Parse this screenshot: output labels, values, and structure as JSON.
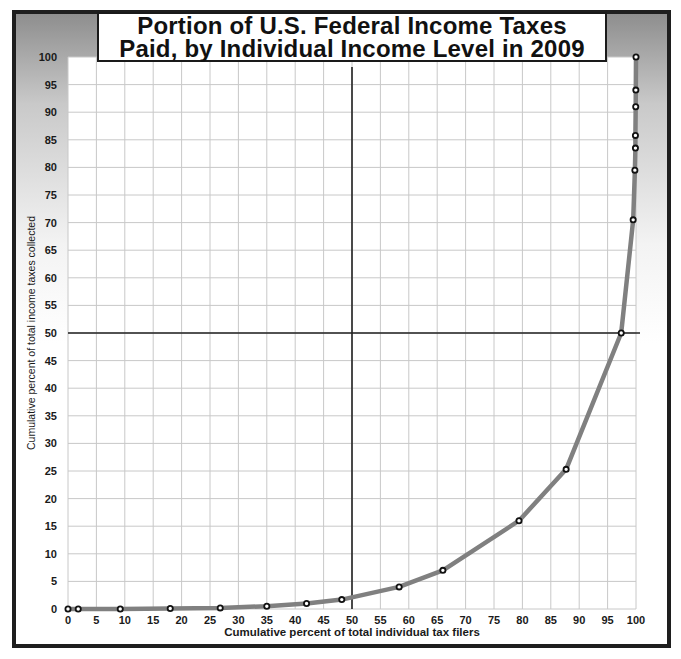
{
  "title": {
    "line1": "Portion of U.S. Federal Income Taxes",
    "line2": "Paid, by Individual Income Level in 2009"
  },
  "chart_data": {
    "type": "line",
    "title": "Portion of U.S. Federal Income Taxes Paid, by Individual Income Level in 2009",
    "xlabel": "Cumulative percent of total individual tax filers",
    "ylabel": "Cumulative percent  of  total income taxes collected",
    "xlim": [
      0,
      100
    ],
    "ylim": [
      0,
      100
    ],
    "x_ticks": [
      0,
      5,
      10,
      15,
      20,
      25,
      30,
      35,
      40,
      45,
      50,
      55,
      60,
      65,
      70,
      75,
      80,
      85,
      90,
      95,
      100
    ],
    "y_ticks": [
      0,
      5,
      10,
      15,
      20,
      25,
      30,
      35,
      40,
      45,
      50,
      55,
      60,
      65,
      70,
      75,
      80,
      85,
      90,
      95,
      100
    ],
    "grid": true,
    "reference_lines": {
      "x": 50,
      "y": 50
    },
    "series": [
      {
        "name": "Cumulative share of income taxes",
        "color": "#808080",
        "marker_color": "#111111",
        "points": [
          [
            0,
            0
          ],
          [
            1.8,
            0
          ],
          [
            9.2,
            0
          ],
          [
            18,
            0.1
          ],
          [
            26.8,
            0.2
          ],
          [
            35,
            0.5
          ],
          [
            42,
            1.0
          ],
          [
            48.2,
            1.7
          ],
          [
            58.3,
            4.0
          ],
          [
            66,
            7.0
          ],
          [
            79.4,
            16.0
          ],
          [
            87.7,
            25.3
          ],
          [
            97.4,
            50.0
          ],
          [
            99.5,
            70.5
          ],
          [
            99.8,
            79.5
          ],
          [
            99.9,
            83.5
          ],
          [
            99.9,
            85.8
          ],
          [
            99.95,
            91.0
          ],
          [
            99.97,
            94.0
          ],
          [
            100,
            100
          ]
        ]
      }
    ]
  },
  "colors": {
    "line": "#808080",
    "grid": "#c8c8c8",
    "reference": "#222222",
    "frame": "#1e1e1e"
  }
}
